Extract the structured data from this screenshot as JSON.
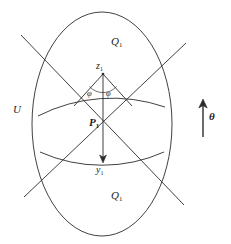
{
  "figure": {
    "background_color": "#ffffff",
    "stroke_color": "#2b2b2b",
    "text_color": "#1c1c1c",
    "labels": {
      "outer_region": "U",
      "upper_region": "Q",
      "upper_region_sub": "1",
      "lower_region": "Q",
      "lower_region_sub": "1",
      "lens_region": "P",
      "lens_region_sub": "1",
      "top_point": "z",
      "top_point_sub": "1",
      "bottom_point": "y",
      "bottom_point_sub": "1",
      "angle_left": "φ",
      "angle_right": "φ",
      "direction": "θ"
    }
  },
  "geometry": {
    "ellipse": {
      "cx": 102,
      "cy": 124,
      "rx": 70,
      "ry": 112
    },
    "upper_arc": {
      "cx": 103,
      "cy": 236,
      "r": 163,
      "from_x": 38,
      "from_y": 116,
      "to_x": 165,
      "to_y": 107
    },
    "lower_arc": {
      "cx": 103,
      "cy": 14,
      "r": 152,
      "from_x": 40,
      "from_y": 152,
      "to_x": 164,
      "to_y": 152
    },
    "line_a": {
      "x1": 21,
      "y1": 35,
      "x2": 184,
      "y2": 205
    },
    "line_b": {
      "x1": 186,
      "y1": 43,
      "x2": 24,
      "y2": 197
    },
    "arrow_vertical": {
      "x": 103,
      "y1": 74,
      "y2": 162
    },
    "angle_mark_left": {
      "x1": 103,
      "y1": 74,
      "x2": 88,
      "y2": 90
    },
    "angle_mark_right": {
      "x1": 103,
      "y1": 74,
      "x2": 118,
      "y2": 90
    },
    "theta_arrow": {
      "x": 203,
      "y_tail": 137,
      "y_head": 100
    },
    "points": {
      "z1": {
        "x": 103,
        "y": 74
      },
      "y1": {
        "x": 103,
        "y": 162
      }
    }
  }
}
